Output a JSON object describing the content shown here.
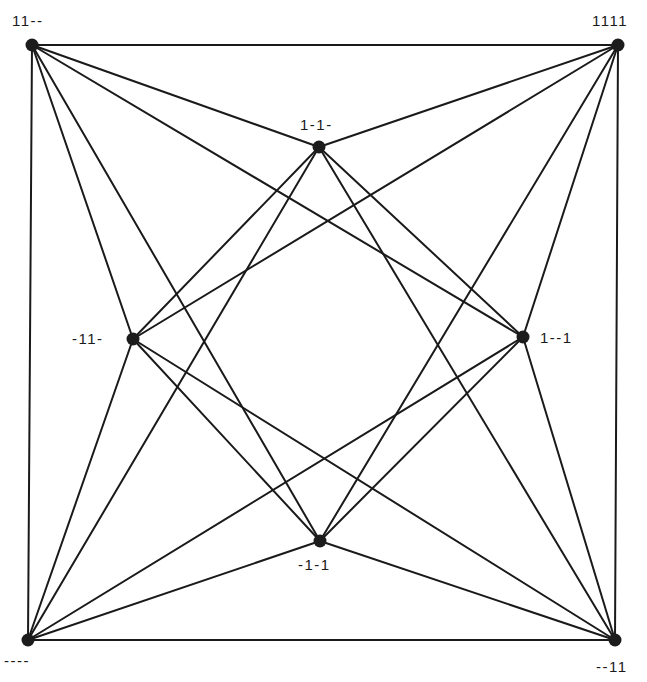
{
  "diagram": {
    "type": "graph",
    "colors": {
      "edge": "#1a1a1a",
      "node": "#1c1c1c",
      "background": "#ffffff"
    },
    "nodes": [
      {
        "id": "A",
        "label": "11--",
        "x": 32,
        "y": 45,
        "lx": 12,
        "ly": 26,
        "anchor": "start"
      },
      {
        "id": "B",
        "label": "1111",
        "x": 618,
        "y": 45,
        "lx": 592,
        "ly": 26,
        "anchor": "start"
      },
      {
        "id": "C",
        "label": "1-1-",
        "x": 319,
        "y": 147,
        "lx": 300,
        "ly": 130,
        "anchor": "start"
      },
      {
        "id": "D",
        "label": "-11-",
        "x": 133,
        "y": 339,
        "lx": 72,
        "ly": 344,
        "anchor": "start"
      },
      {
        "id": "E",
        "label": "1--1",
        "x": 523,
        "y": 337,
        "lx": 540,
        "ly": 343,
        "anchor": "start"
      },
      {
        "id": "F",
        "label": "-1-1",
        "x": 320,
        "y": 541,
        "lx": 298,
        "ly": 570,
        "anchor": "start"
      },
      {
        "id": "G",
        "label": "----",
        "x": 28,
        "y": 640,
        "lx": 4,
        "ly": 666,
        "anchor": "start"
      },
      {
        "id": "H",
        "label": "--11",
        "x": 615,
        "y": 640,
        "lx": 596,
        "ly": 672,
        "anchor": "start"
      }
    ],
    "edges": [
      [
        "A",
        "B"
      ],
      [
        "B",
        "H"
      ],
      [
        "H",
        "G"
      ],
      [
        "G",
        "A"
      ],
      [
        "A",
        "C"
      ],
      [
        "A",
        "D"
      ],
      [
        "A",
        "E"
      ],
      [
        "A",
        "F"
      ],
      [
        "B",
        "C"
      ],
      [
        "B",
        "D"
      ],
      [
        "B",
        "E"
      ],
      [
        "B",
        "F"
      ],
      [
        "G",
        "C"
      ],
      [
        "G",
        "D"
      ],
      [
        "G",
        "E"
      ],
      [
        "G",
        "F"
      ],
      [
        "H",
        "C"
      ],
      [
        "H",
        "D"
      ],
      [
        "H",
        "E"
      ],
      [
        "H",
        "F"
      ],
      [
        "C",
        "D"
      ],
      [
        "D",
        "F"
      ],
      [
        "F",
        "E"
      ],
      [
        "E",
        "C"
      ]
    ]
  }
}
